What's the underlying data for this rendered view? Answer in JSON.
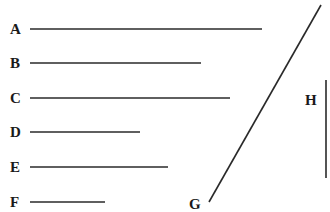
{
  "colors": {
    "line": "#2a2a2a",
    "text": "#1a1a1a",
    "background": "#ffffff"
  },
  "segments": [
    {
      "label": "A",
      "orientation": "horizontal",
      "x1": 30,
      "y1": 29,
      "x2": 262,
      "y2": 29,
      "label_x": 10,
      "label_y": 34
    },
    {
      "label": "B",
      "orientation": "horizontal",
      "x1": 30,
      "y1": 63,
      "x2": 201,
      "y2": 63,
      "label_x": 10,
      "label_y": 68
    },
    {
      "label": "C",
      "orientation": "horizontal",
      "x1": 30,
      "y1": 98,
      "x2": 230,
      "y2": 98,
      "label_x": 10,
      "label_y": 103
    },
    {
      "label": "D",
      "orientation": "horizontal",
      "x1": 30,
      "y1": 132,
      "x2": 140,
      "y2": 132,
      "label_x": 10,
      "label_y": 137
    },
    {
      "label": "E",
      "orientation": "horizontal",
      "x1": 30,
      "y1": 167,
      "x2": 168,
      "y2": 167,
      "label_x": 10,
      "label_y": 172
    },
    {
      "label": "F",
      "orientation": "horizontal",
      "x1": 30,
      "y1": 202,
      "x2": 105,
      "y2": 202,
      "label_x": 10,
      "label_y": 207
    },
    {
      "label": "G",
      "orientation": "diagonal",
      "x1": 209,
      "y1": 202,
      "x2": 321,
      "y2": 5,
      "label_x": 189,
      "label_y": 209
    },
    {
      "label": "H",
      "orientation": "vertical",
      "x1": 326,
      "y1": 80,
      "x2": 326,
      "y2": 178,
      "label_x": 305,
      "label_y": 105
    }
  ]
}
